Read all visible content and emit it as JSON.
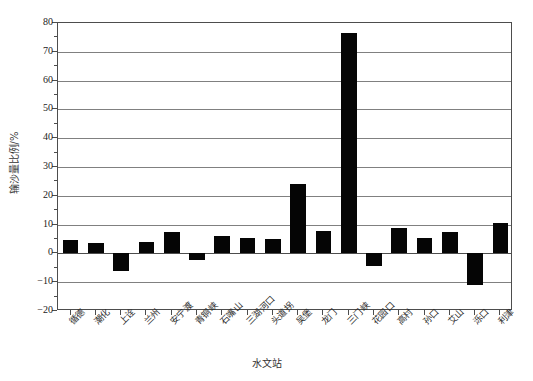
{
  "chart_data": {
    "type": "bar",
    "title": "",
    "xlabel": "水文站",
    "ylabel": "输沙量比例/%",
    "ylim": [
      -20,
      80
    ],
    "ytick_step": 10,
    "yminor_step": 5,
    "grid": true,
    "legend": "none",
    "bar_color": "#050505",
    "categories": [
      "下河沿",
      "青铜峡",
      "石嘴山",
      "兰州",
      "安宁渡",
      "青铜峡",
      "石嘴山",
      "三湖河口",
      "头道拐",
      "吴堡",
      "龙门",
      "三门峡",
      "花园口",
      "高村",
      "孙口",
      "艾山",
      "泺口",
      "利津"
    ],
    "categories_display": [
      "循德",
      "潮化",
      "上诠",
      "兰州",
      "安宁渡",
      "青铜峡",
      "石嘴山",
      "三湖河口",
      "头道拐",
      "吴堡",
      "龙门",
      "三门峡",
      "花园口",
      "高村",
      "孙口",
      "艾山",
      "泺口",
      "利津"
    ],
    "values": [
      4.8,
      3.5,
      -6.0,
      4.0,
      7.5,
      -2.2,
      6.2,
      5.5,
      5.0,
      24.2,
      7.8,
      76.5,
      -4.5,
      8.8,
      5.5,
      7.5,
      -11.0,
      10.5
    ],
    "ytick_labels": [
      "80",
      "70",
      "60",
      "50",
      "40",
      "30",
      "20",
      "10",
      "0",
      "-10",
      "-20"
    ]
  },
  "axis": {
    "y_title": "输沙量比例/%",
    "x_title": "水文站"
  }
}
